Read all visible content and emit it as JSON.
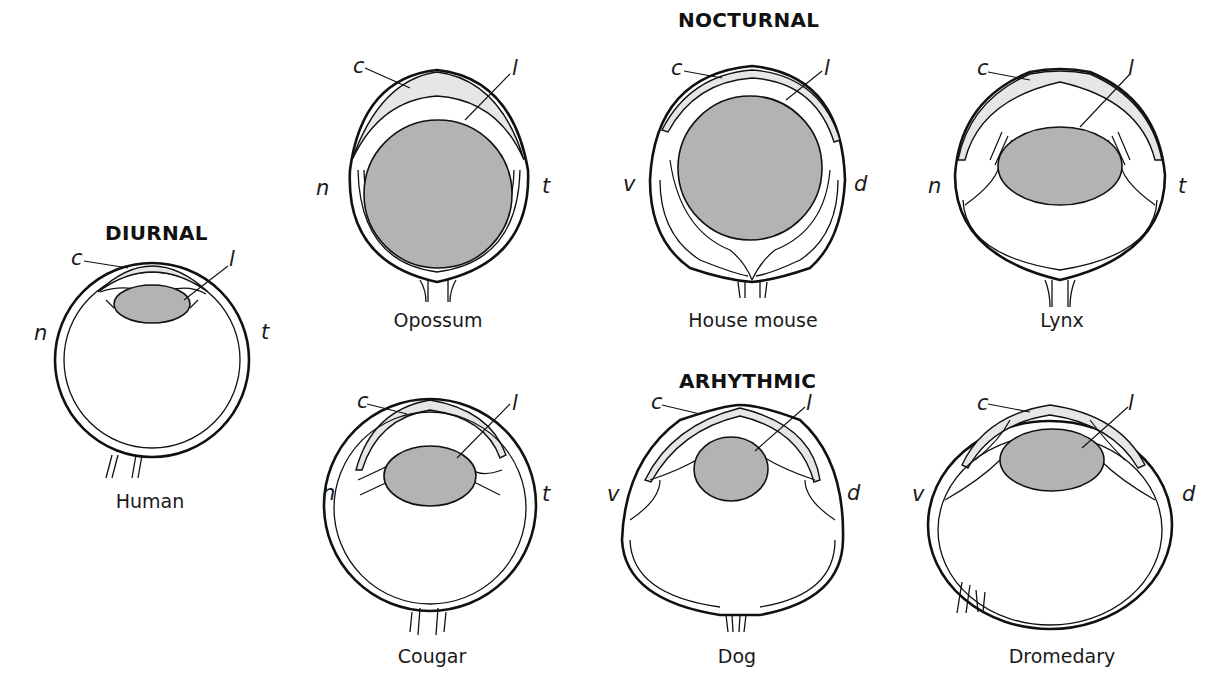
{
  "groups": {
    "diurnal": "DIURNAL",
    "nocturnal": "NOCTURNAL",
    "arhythmic": "ARHYTHMIC"
  },
  "part_labels": {
    "cornea": "c",
    "lens": "l"
  },
  "orientation_labels": {
    "nasal": "n",
    "temporal": "t",
    "ventral": "v",
    "dorsal": "d"
  },
  "eyes": [
    {
      "name": "Human",
      "group": "DIURNAL",
      "left": "n",
      "right": "t"
    },
    {
      "name": "Opossum",
      "group": "NOCTURNAL",
      "left": "n",
      "right": "t"
    },
    {
      "name": "House mouse",
      "group": "NOCTURNAL",
      "left": "v",
      "right": "d"
    },
    {
      "name": "Lynx",
      "group": "NOCTURNAL",
      "left": "n",
      "right": "t"
    },
    {
      "name": "Cougar",
      "group": "ARHYTHMIC",
      "left": "n",
      "right": "t"
    },
    {
      "name": "Dog",
      "group": "ARHYTHMIC",
      "left": "v",
      "right": "d"
    },
    {
      "name": "Dromedary",
      "group": "ARHYTHMIC",
      "left": "v",
      "right": "d"
    }
  ],
  "colors": {
    "lens_fill": "#b3b3b3",
    "cornea_fill": "#e6e6e6",
    "outline": "#111111"
  }
}
